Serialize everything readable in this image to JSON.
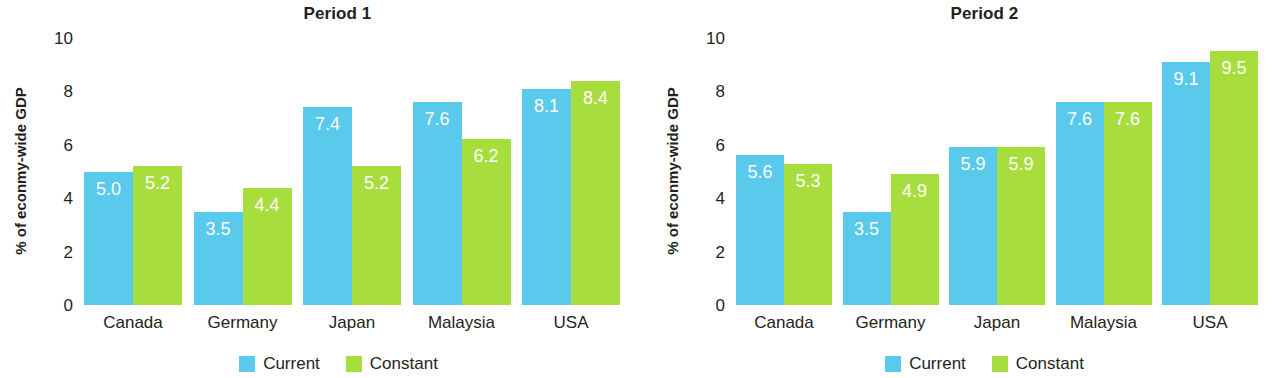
{
  "chart_data": [
    {
      "type": "bar",
      "title": "Period 1",
      "xlabel": "",
      "ylabel": "% of econmy-wide GDP",
      "ylim": [
        0,
        10
      ],
      "yticks": [
        10,
        8,
        6,
        4,
        2,
        0
      ],
      "grid": false,
      "legend_position": "bottom",
      "categories": [
        "Canada",
        "Germany",
        "Japan",
        "Malaysia",
        "USA"
      ],
      "series": [
        {
          "name": "Current",
          "color": "#59c9ec",
          "values": [
            5.0,
            3.5,
            7.4,
            7.6,
            8.1
          ],
          "labels": [
            "5.0",
            "3.5",
            "7.4",
            "7.6",
            "8.1"
          ]
        },
        {
          "name": "Constant",
          "color": "#a8dd3e",
          "values": [
            5.2,
            4.4,
            5.2,
            6.2,
            8.4
          ],
          "labels": [
            "5.2",
            "4.4",
            "5.2",
            "6.2",
            "8.4"
          ]
        }
      ]
    },
    {
      "type": "bar",
      "title": "Period 2",
      "xlabel": "",
      "ylabel": "% of econmy-wide GDP",
      "ylim": [
        0,
        10
      ],
      "yticks": [
        10,
        8,
        6,
        4,
        2,
        0
      ],
      "grid": false,
      "legend_position": "bottom",
      "categories": [
        "Canada",
        "Germany",
        "Japan",
        "Malaysia",
        "USA"
      ],
      "series": [
        {
          "name": "Current",
          "color": "#59c9ec",
          "values": [
            5.6,
            3.5,
            5.9,
            7.6,
            9.1
          ],
          "labels": [
            "5.6",
            "3.5",
            "5.9",
            "7.6",
            "9.1"
          ]
        },
        {
          "name": "Constant",
          "color": "#a8dd3e",
          "values": [
            5.3,
            4.9,
            5.9,
            7.6,
            9.5
          ],
          "labels": [
            "5.3",
            "4.9",
            "5.9",
            "7.6",
            "9.5"
          ]
        }
      ]
    }
  ]
}
